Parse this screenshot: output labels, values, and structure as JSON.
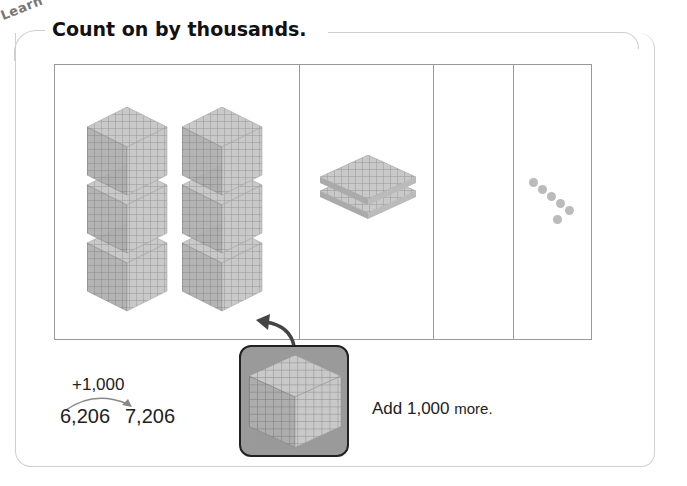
{
  "section_label": "Learn",
  "title": "Count on by thousands.",
  "place_value_chart": {
    "columns": [
      {
        "name": "thousands",
        "count": 6
      },
      {
        "name": "hundreds",
        "count": 2
      },
      {
        "name": "tens",
        "count": 0
      },
      {
        "name": "ones",
        "count": 6
      }
    ]
  },
  "addition": {
    "operator_label": "+1,000",
    "start_value": "6,206",
    "end_value": "7,206"
  },
  "added_block": "thousand-cube",
  "instruction": {
    "main": "Add 1,000",
    "suffix": "more."
  },
  "colors": {
    "block_gray": "#b5b5b5",
    "card_bg": "#9a9a9a",
    "border": "#999999"
  }
}
